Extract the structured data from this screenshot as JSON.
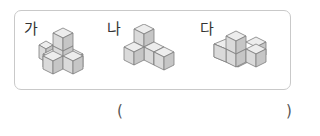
{
  "figures": [
    {
      "label": "가",
      "cube_count": 5
    },
    {
      "label": "나",
      "cube_count": 5
    },
    {
      "label": "다",
      "cube_count": 5
    }
  ],
  "answer": {
    "open_paren": "(",
    "close_paren": ")",
    "value": ""
  },
  "colors": {
    "cube_top": "#ededed",
    "cube_front": "#dadada",
    "cube_side": "#c6c6c6",
    "cube_edge": "#7d7d7d",
    "frame_border": "#c9c9c9"
  }
}
